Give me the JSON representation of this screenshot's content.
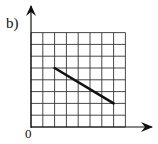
{
  "diagram": {
    "label": "b)",
    "origin_label": "0",
    "grid": {
      "cols": 8,
      "rows": 8
    },
    "segment": {
      "from": [
        2,
        5
      ],
      "to": [
        7,
        2
      ]
    },
    "colors": {
      "grid": "#222222",
      "line": "#111111"
    }
  },
  "chart_data": {
    "type": "line",
    "title": "b)",
    "xlabel": "",
    "ylabel": "",
    "x": [
      2,
      7
    ],
    "series": [
      {
        "name": "segment",
        "values": [
          5,
          2
        ]
      }
    ],
    "xlim": [
      0,
      8
    ],
    "ylim": [
      0,
      8
    ],
    "grid": true,
    "tick_labels": [
      "0"
    ]
  }
}
